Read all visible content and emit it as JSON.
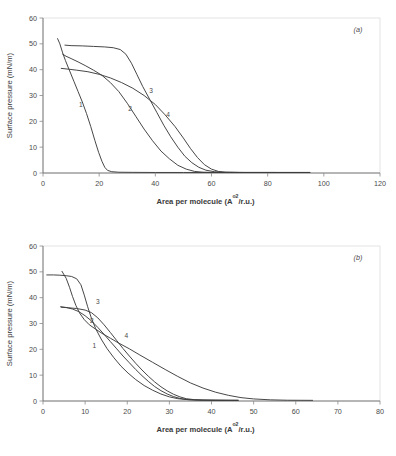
{
  "figure": {
    "panels": [
      "a",
      "b"
    ]
  },
  "chart_data": [
    {
      "type": "line",
      "panel_label": "(a)",
      "title": "",
      "xlabel_text": "Area per molecule (A",
      "xlabel_sup": "o2",
      "xlabel_tail": "/r.u.)",
      "ylabel": "Surface pressure (mN/m)",
      "xlim": [
        0,
        120
      ],
      "ylim": [
        0,
        60
      ],
      "xticks": [
        0,
        20,
        40,
        60,
        80,
        100,
        120
      ],
      "yticks": [
        0,
        10,
        20,
        30,
        40,
        50,
        60
      ],
      "grid": false,
      "legend": "inline curve numbers",
      "series": [
        {
          "name": "1",
          "label": "1",
          "label_x": 13.5,
          "label_y": 25.5,
          "points": [
            [
              5.2,
              52.0
            ],
            [
              6.0,
              50.0
            ],
            [
              7.0,
              46.5
            ],
            [
              8.0,
              43.5
            ],
            [
              9.5,
              39.5
            ],
            [
              11.0,
              35.5
            ],
            [
              12.5,
              31.5
            ],
            [
              14.0,
              27.5
            ],
            [
              15.5,
              23.0
            ],
            [
              17.0,
              18.0
            ],
            [
              18.5,
              12.5
            ],
            [
              19.8,
              8.0
            ],
            [
              21.0,
              4.5
            ],
            [
              22.0,
              2.2
            ],
            [
              23.0,
              1.0
            ],
            [
              24.5,
              0.5
            ],
            [
              27.0,
              0.3
            ],
            [
              32.0,
              0.25
            ],
            [
              40.0,
              0.2
            ],
            [
              50.0,
              0.2
            ],
            [
              60.0,
              0.2
            ],
            [
              70.0,
              0.2
            ],
            [
              83.0,
              0.2
            ],
            [
              95.0,
              0.2
            ]
          ]
        },
        {
          "name": "2",
          "label": "2",
          "label_x": 31.0,
          "label_y": 24.0,
          "points": [
            [
              7.0,
              46.0
            ],
            [
              8.2,
              45.2
            ],
            [
              10.0,
              44.3
            ],
            [
              12.5,
              43.0
            ],
            [
              15.0,
              41.6
            ],
            [
              18.0,
              39.8
            ],
            [
              21.0,
              37.8
            ],
            [
              24.0,
              35.0
            ],
            [
              27.0,
              31.5
            ],
            [
              30.0,
              27.0
            ],
            [
              33.0,
              22.0
            ],
            [
              36.0,
              17.0
            ],
            [
              39.0,
              12.5
            ],
            [
              42.0,
              8.5
            ],
            [
              45.0,
              5.5
            ],
            [
              48.0,
              3.0
            ],
            [
              51.0,
              1.5
            ],
            [
              54.0,
              0.6
            ],
            [
              57.0,
              0.3
            ],
            [
              62.0,
              0.2
            ],
            [
              70.0,
              0.2
            ],
            [
              83.0,
              0.2
            ]
          ]
        },
        {
          "name": "3",
          "label": "3",
          "label_x": 38.5,
          "label_y": 31.0,
          "points": [
            [
              7.8,
              49.5
            ],
            [
              10.0,
              49.3
            ],
            [
              14.0,
              49.2
            ],
            [
              18.0,
              49.0
            ],
            [
              22.0,
              48.8
            ],
            [
              25.0,
              48.5
            ],
            [
              27.5,
              47.8
            ],
            [
              29.5,
              46.0
            ],
            [
              31.5,
              42.5
            ],
            [
              33.5,
              38.0
            ],
            [
              35.5,
              33.5
            ],
            [
              38.0,
              28.5
            ],
            [
              40.5,
              23.5
            ],
            [
              43.0,
              18.5
            ],
            [
              45.5,
              14.0
            ],
            [
              48.0,
              10.0
            ],
            [
              50.5,
              6.5
            ],
            [
              53.0,
              4.0
            ],
            [
              55.5,
              2.2
            ],
            [
              58.0,
              1.1
            ],
            [
              61.0,
              0.5
            ],
            [
              64.0,
              0.3
            ],
            [
              70.0,
              0.2
            ],
            [
              83.0,
              0.2
            ],
            [
              95.0,
              0.2
            ]
          ]
        },
        {
          "name": "4",
          "label": "4",
          "label_x": 44.5,
          "label_y": 21.5,
          "points": [
            [
              6.5,
              40.5
            ],
            [
              9.0,
              40.2
            ],
            [
              12.0,
              39.8
            ],
            [
              16.0,
              39.2
            ],
            [
              20.0,
              38.2
            ],
            [
              24.0,
              36.8
            ],
            [
              28.0,
              35.0
            ],
            [
              32.0,
              32.8
            ],
            [
              36.0,
              30.0
            ],
            [
              40.0,
              26.5
            ],
            [
              43.5,
              22.5
            ],
            [
              47.0,
              18.0
            ],
            [
              50.0,
              13.5
            ],
            [
              52.5,
              9.5
            ],
            [
              55.0,
              6.0
            ],
            [
              57.5,
              3.2
            ],
            [
              60.0,
              1.5
            ],
            [
              62.5,
              0.6
            ],
            [
              65.0,
              0.3
            ],
            [
              72.0,
              0.2
            ],
            [
              83.0,
              0.2
            ],
            [
              95.0,
              0.2
            ]
          ]
        }
      ]
    },
    {
      "type": "line",
      "panel_label": "(b)",
      "title": "",
      "xlabel_text": "Area per molecule (A",
      "xlabel_sup": "o2",
      "xlabel_tail": "/r.u.)",
      "ylabel": "Surface pressure (mN/m)",
      "xlim": [
        0,
        80
      ],
      "ylim": [
        0,
        60
      ],
      "xticks": [
        0,
        10,
        20,
        30,
        40,
        50,
        60,
        70,
        80
      ],
      "yticks": [
        0,
        10,
        20,
        30,
        40,
        50,
        60
      ],
      "grid": false,
      "legend": "inline curve numbers",
      "series": [
        {
          "name": "1",
          "label": "1",
          "label_x": 12.2,
          "label_y": 20.5,
          "points": [
            [
              4.2,
              36.5
            ],
            [
              5.5,
              36.2
            ],
            [
              7.0,
              35.6
            ],
            [
              8.5,
              34.6
            ],
            [
              10.0,
              33.0
            ],
            [
              11.5,
              31.0
            ],
            [
              13.0,
              28.5
            ],
            [
              14.5,
              25.8
            ],
            [
              16.0,
              23.0
            ],
            [
              17.5,
              20.2
            ],
            [
              19.0,
              17.4
            ],
            [
              20.5,
              14.8
            ],
            [
              22.0,
              12.2
            ],
            [
              23.5,
              9.8
            ],
            [
              25.0,
              7.6
            ],
            [
              26.5,
              5.6
            ],
            [
              28.0,
              4.0
            ],
            [
              29.5,
              2.7
            ],
            [
              31.0,
              1.7
            ],
            [
              32.5,
              1.0
            ],
            [
              34.0,
              0.6
            ],
            [
              36.0,
              0.4
            ],
            [
              39.0,
              0.3
            ],
            [
              43.0,
              0.25
            ],
            [
              46.3,
              0.25
            ]
          ]
        },
        {
          "name": "2",
          "label": "2",
          "label_x": 11.6,
          "label_y": 30.2,
          "points": [
            [
              4.3,
              36.3
            ],
            [
              6.0,
              36.1
            ],
            [
              8.0,
              35.8
            ],
            [
              10.0,
              35.2
            ],
            [
              11.5,
              34.2
            ],
            [
              13.0,
              32.2
            ],
            [
              14.5,
              29.5
            ],
            [
              16.0,
              26.5
            ],
            [
              17.5,
              23.4
            ],
            [
              19.0,
              20.3
            ],
            [
              20.5,
              17.4
            ],
            [
              22.0,
              14.6
            ],
            [
              23.5,
              12.0
            ],
            [
              25.0,
              9.6
            ],
            [
              26.5,
              7.4
            ],
            [
              28.0,
              5.5
            ],
            [
              29.5,
              3.9
            ],
            [
              31.0,
              2.6
            ],
            [
              32.5,
              1.6
            ],
            [
              34.0,
              0.9
            ],
            [
              36.0,
              0.5
            ],
            [
              38.0,
              0.35
            ],
            [
              41.0,
              0.3
            ],
            [
              44.0,
              0.25
            ],
            [
              46.3,
              0.25
            ]
          ]
        },
        {
          "name": "3",
          "label": "3",
          "label_x": 13.0,
          "label_y": 37.5,
          "points": [
            [
              0.9,
              48.8
            ],
            [
              2.5,
              48.8
            ],
            [
              4.0,
              48.7
            ],
            [
              5.5,
              48.5
            ],
            [
              6.8,
              48.2
            ],
            [
              8.0,
              47.3
            ],
            [
              9.0,
              45.0
            ],
            [
              9.8,
              41.0
            ],
            [
              10.6,
              36.5
            ],
            [
              11.5,
              32.0
            ],
            [
              12.5,
              28.0
            ],
            [
              13.8,
              24.0
            ],
            [
              15.2,
              20.3
            ],
            [
              16.8,
              16.8
            ],
            [
              18.5,
              13.5
            ],
            [
              20.2,
              10.8
            ],
            [
              22.0,
              8.3
            ],
            [
              24.0,
              6.0
            ],
            [
              26.0,
              4.2
            ],
            [
              28.0,
              2.7
            ],
            [
              30.0,
              1.6
            ],
            [
              32.0,
              0.9
            ],
            [
              34.5,
              0.5
            ],
            [
              37.5,
              0.35
            ],
            [
              41.0,
              0.3
            ],
            [
              46.3,
              0.25
            ]
          ]
        },
        {
          "name": "4",
          "label": "4",
          "label_x": 19.8,
          "label_y": 24.5,
          "points": [
            [
              4.5,
              50.2
            ],
            [
              5.5,
              47.5
            ],
            [
              6.3,
              44.0
            ],
            [
              7.0,
              40.5
            ],
            [
              7.8,
              37.0
            ],
            [
              8.7,
              34.0
            ],
            [
              9.8,
              31.5
            ],
            [
              11.0,
              29.5
            ],
            [
              12.5,
              27.8
            ],
            [
              14.0,
              26.2
            ],
            [
              16.0,
              24.3
            ],
            [
              18.0,
              22.4
            ],
            [
              20.5,
              20.2
            ],
            [
              23.0,
              17.8
            ],
            [
              26.0,
              15.0
            ],
            [
              29.0,
              12.2
            ],
            [
              32.0,
              9.5
            ],
            [
              35.0,
              7.0
            ],
            [
              38.0,
              5.0
            ],
            [
              41.0,
              3.4
            ],
            [
              44.0,
              2.2
            ],
            [
              47.0,
              1.3
            ],
            [
              50.0,
              0.8
            ],
            [
              54.0,
              0.45
            ],
            [
              58.0,
              0.3
            ],
            [
              64.0,
              0.25
            ]
          ]
        }
      ]
    }
  ]
}
